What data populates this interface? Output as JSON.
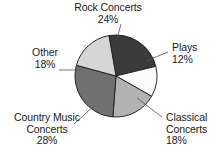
{
  "chart_data": {
    "type": "pie",
    "title": "",
    "subtitle": "",
    "xlabel": "",
    "ylabel": "",
    "legend_position": "none",
    "grid": false,
    "units": "percent",
    "total": 100,
    "categories": [
      "Rock Concerts",
      "Plays",
      "Classical Concerts",
      "Country Music Concerts",
      "Other"
    ],
    "values": [
      24,
      12,
      18,
      28,
      18
    ],
    "slices": [
      {
        "name": "rock-concerts",
        "label_lines": [
          "Rock Concerts",
          "24%"
        ],
        "label_text": "Rock Concerts",
        "value_text": "24%",
        "value": 24,
        "color": "#3a3a3a",
        "start_angle": -10,
        "end_angle": 76.4
      },
      {
        "name": "plays",
        "label_lines": [
          "Plays",
          "12%"
        ],
        "label_text": "Plays",
        "value_text": "12%",
        "value": 12,
        "color": "#fbfbfb",
        "start_angle": 76.4,
        "end_angle": 119.6
      },
      {
        "name": "classical-concerts",
        "label_lines": [
          "Classical",
          "Concerts",
          "18%"
        ],
        "label_text": "Classical Concerts",
        "value_text": "18%",
        "value": 18,
        "color": "#b2b2b2",
        "start_angle": 119.6,
        "end_angle": 184.4
      },
      {
        "name": "country-music-concerts",
        "label_lines": [
          "Country Music",
          "Concerts",
          "28%"
        ],
        "label_text": "Country Music Concerts",
        "value_text": "28%",
        "value": 28,
        "color": "#707070",
        "start_angle": 184.4,
        "end_angle": 285.2
      },
      {
        "name": "other",
        "label_lines": [
          "Other",
          "18%"
        ],
        "label_text": "Other",
        "value_text": "18%",
        "value": 18,
        "color": "#d6d6d6",
        "start_angle": 285.2,
        "end_angle": 350
      }
    ],
    "geometry": {
      "center_x": 116,
      "center_y": 76,
      "radius": 41
    },
    "stroke_color": "#1b1b1b"
  },
  "labels": {
    "rock": {
      "line1": "Rock Concerts",
      "line2": "24%"
    },
    "plays": {
      "line1": "Plays",
      "line2": "12%"
    },
    "classical": {
      "line1": "Classical",
      "line2": "Concerts",
      "line3": "18%"
    },
    "country": {
      "line1": "Country Music",
      "line2": "Concerts",
      "line3": "28%"
    },
    "other": {
      "line1": "Other",
      "line2": "18%"
    }
  }
}
